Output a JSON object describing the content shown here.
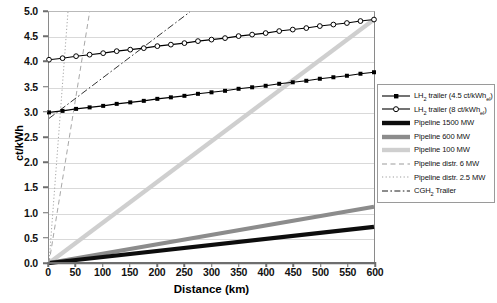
{
  "chart_data": {
    "type": "line",
    "title": "",
    "xlabel": "Distance (km)",
    "ylabel": "ct/kWh",
    "xlim": [
      0,
      600
    ],
    "ylim": [
      0.0,
      5.0
    ],
    "xticks": [
      0,
      50,
      100,
      150,
      200,
      250,
      300,
      350,
      400,
      450,
      500,
      550,
      600
    ],
    "yticks": [
      "0.0",
      "0.5",
      "1.0",
      "1.5",
      "2.0",
      "2.5",
      "3.0",
      "3.5",
      "4.0",
      "4.5",
      "5.0"
    ],
    "grid": true,
    "legend_position": "right",
    "series": [
      {
        "name": "LH2 trailer (4.5 ct/kWh_el)",
        "label_html": "LH<sub>2</sub> trailer (4.5 ct/kWh<sub>el</sub>)",
        "style": "line-markers",
        "marker": "filled-square",
        "color": "#000000",
        "x": [
          0,
          25,
          50,
          75,
          100,
          125,
          150,
          175,
          200,
          225,
          250,
          275,
          300,
          325,
          350,
          375,
          400,
          425,
          450,
          475,
          500,
          525,
          550,
          575,
          600
        ],
        "y": [
          3.0,
          3.03,
          3.07,
          3.1,
          3.13,
          3.17,
          3.2,
          3.23,
          3.27,
          3.3,
          3.33,
          3.37,
          3.4,
          3.43,
          3.47,
          3.5,
          3.53,
          3.57,
          3.6,
          3.63,
          3.67,
          3.7,
          3.73,
          3.77,
          3.8
        ]
      },
      {
        "name": "LH2 trailer (8 ct/kWh_el)",
        "label_html": "LH<sub>2</sub> trailer (8 ct/kWh<sub>el</sub>)",
        "style": "line-markers",
        "marker": "open-circle",
        "color": "#000000",
        "x": [
          0,
          25,
          50,
          75,
          100,
          125,
          150,
          175,
          200,
          225,
          250,
          275,
          300,
          325,
          350,
          375,
          400,
          425,
          450,
          475,
          500,
          525,
          550,
          575,
          600
        ],
        "y": [
          4.05,
          4.08,
          4.12,
          4.15,
          4.18,
          4.22,
          4.25,
          4.28,
          4.32,
          4.35,
          4.38,
          4.42,
          4.45,
          4.48,
          4.52,
          4.55,
          4.58,
          4.62,
          4.65,
          4.68,
          4.72,
          4.75,
          4.78,
          4.82,
          4.85
        ]
      },
      {
        "name": "Pipeline 1500 MW",
        "label_html": "Pipeline 1500 MW",
        "style": "thick-line",
        "color": "#0d0d0d",
        "x": [
          0,
          600
        ],
        "y": [
          0.0,
          0.72
        ]
      },
      {
        "name": "Pipeline 600 MW",
        "label_html": "Pipeline 600 MW",
        "style": "thick-line",
        "color": "#8c8c8c",
        "x": [
          0,
          600
        ],
        "y": [
          0.0,
          1.12
        ]
      },
      {
        "name": "Pipeline 100 MW",
        "label_html": "Pipeline 100 MW",
        "style": "thick-line",
        "color": "#cfcfcf",
        "x": [
          0,
          600
        ],
        "y": [
          0.0,
          4.85
        ]
      },
      {
        "name": "Pipeline distr. 6 MW",
        "label_html": "Pipeline distr. 6 MW",
        "style": "dashed",
        "color": "#9b9b9b",
        "x": [
          0,
          75
        ],
        "y": [
          0.0,
          5.0
        ]
      },
      {
        "name": "Pipeline distr. 2.5 MW",
        "label_html": "Pipeline distr. 2.5 MW",
        "style": "dotted",
        "color": "#9b9b9b",
        "x": [
          0,
          35
        ],
        "y": [
          0.0,
          5.0
        ]
      },
      {
        "name": "CGH2 Trailer",
        "label_html": "CGH<sub>2</sub> Trailer",
        "style": "dash-dot",
        "color": "#1a1a1a",
        "x": [
          0,
          260
        ],
        "y": [
          2.88,
          5.0
        ]
      }
    ]
  },
  "legend": {
    "items": [
      {
        "label_html": "LH<sub>2</sub> trailer (4.5 ct/kWh<sub>el</sub>)",
        "key": "line-filled-square"
      },
      {
        "label_html": "LH<sub>2</sub> trailer (8 ct/kWh<sub>el</sub>)",
        "key": "line-open-circle"
      },
      {
        "label_html": "Pipeline 1500 MW",
        "key": "thick-black"
      },
      {
        "label_html": "Pipeline 600 MW",
        "key": "thick-gray"
      },
      {
        "label_html": "Pipeline 100 MW",
        "key": "thick-lightgray"
      },
      {
        "label_html": "Pipeline distr. 6 MW",
        "key": "dashed-gray"
      },
      {
        "label_html": "Pipeline distr. 2.5 MW",
        "key": "dotted-gray"
      },
      {
        "label_html": "CGH<sub>2</sub> Trailer",
        "key": "dashdot-black"
      }
    ]
  },
  "colors": {
    "axis": "#6e6e6e",
    "grid": "#d9d9d9",
    "pipeline_1500": "#0d0d0d",
    "pipeline_600": "#8c8c8c",
    "pipeline_100": "#cfcfcf",
    "distr": "#9b9b9b",
    "cgh2": "#1a1a1a",
    "lh2": "#000000"
  }
}
